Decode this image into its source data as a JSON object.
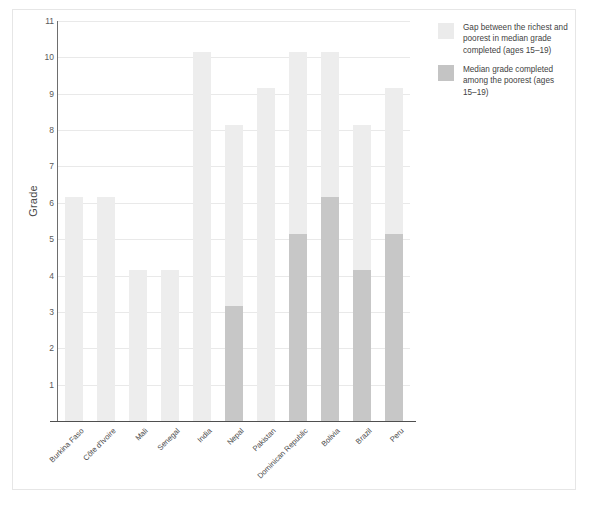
{
  "chart_data": {
    "type": "bar",
    "title": "",
    "subtitle": "",
    "xlabel": "",
    "ylabel": "Grade",
    "ylim": [
      0,
      11
    ],
    "yticks": [
      1,
      2,
      3,
      4,
      5,
      6,
      7,
      8,
      9,
      10,
      11
    ],
    "grid": true,
    "stacked": true,
    "legend_position": "right",
    "categories": [
      "Burkina Faso",
      "Côte d'Ivoire",
      "Mali",
      "Senegal",
      "India",
      "Nepal",
      "Pakistan",
      "Dominican Republic",
      "Bolivia",
      "Brazil",
      "Peru"
    ],
    "series": [
      {
        "name": "Median grade completed among the poorest (ages 15–19)",
        "color": "#c7c7c7",
        "values": [
          0,
          0,
          0,
          0,
          0,
          3.15,
          0,
          5.15,
          6.15,
          4.15,
          5.15
        ]
      },
      {
        "name": "Gap between the richest and poorest in median grade completed (ages 15–19)",
        "color": "#ededed",
        "values": [
          6.15,
          6.15,
          4.15,
          4.15,
          10.15,
          5.0,
          9.15,
          5.0,
          4.0,
          4.0,
          4.0
        ]
      }
    ],
    "totals": [
      6.15,
      6.15,
      4.15,
      4.15,
      10.15,
      8.15,
      9.15,
      10.15,
      10.15,
      8.15,
      9.15
    ]
  },
  "legend": {
    "items": [
      {
        "swatch": "gap",
        "label": "Gap between the richest and poorest in median grade completed (ages 15–19)"
      },
      {
        "swatch": "poorest",
        "label": "Median grade completed among the poorest (ages 15–19)"
      }
    ]
  },
  "axes": {
    "y_title": "Grade"
  }
}
